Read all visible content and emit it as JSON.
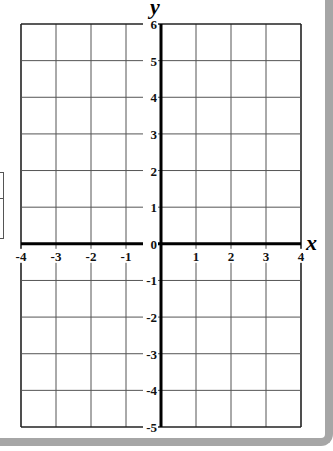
{
  "chart_data": {
    "type": "coordinate-grid",
    "title": "",
    "xlabel": "x",
    "ylabel": "y",
    "xlim": [
      -4,
      4
    ],
    "ylim": [
      -5,
      6
    ],
    "grid": true,
    "x_ticks": [
      "-4",
      "-3",
      "-2",
      "-1",
      "1",
      "2",
      "3",
      "4"
    ],
    "y_ticks": [
      "6",
      "5",
      "4",
      "3",
      "2",
      "1",
      "0",
      "-1",
      "-2",
      "-3",
      "-4",
      "-5"
    ],
    "series": []
  },
  "axes": {
    "x_label": "x",
    "y_label": "y"
  },
  "colors": {
    "grid_line": "#555555",
    "axis_line": "#000000",
    "frame": "#a6a6a6"
  }
}
